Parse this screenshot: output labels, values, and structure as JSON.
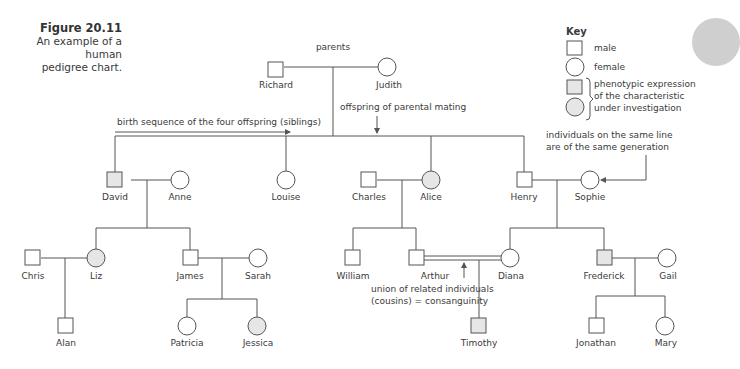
{
  "figure": {
    "number": "Figure 20.11",
    "caption_line1": "An example of a human",
    "caption_line2": "pedigree chart."
  },
  "key": {
    "title": "Key",
    "male": "male",
    "female": "female",
    "affected_line1": "phenotypic expression",
    "affected_line2": "of the characteristic",
    "affected_line3": "under investigation"
  },
  "annotations": {
    "parents": "parents",
    "offspring": "offspring of parental mating",
    "birth_sequence": "birth sequence of the four offspring (siblings)",
    "generation_line1": "individuals on the same line",
    "generation_line2": "are of the same generation",
    "consanguinity_line1": "union of related individuals",
    "consanguinity_line2": "(cousins) = consanguinity"
  },
  "colors": {
    "line": "#555555",
    "affected_fill": "#e6e6e6",
    "unaffected_fill": "#ffffff"
  },
  "individuals": [
    {
      "name": "Richard",
      "sex": "male",
      "affected": false,
      "generation": 1
    },
    {
      "name": "Judith",
      "sex": "female",
      "affected": false,
      "generation": 1
    },
    {
      "name": "David",
      "sex": "male",
      "affected": true,
      "generation": 2
    },
    {
      "name": "Anne",
      "sex": "female",
      "affected": false,
      "generation": 2
    },
    {
      "name": "Louise",
      "sex": "female",
      "affected": false,
      "generation": 2
    },
    {
      "name": "Charles",
      "sex": "male",
      "affected": false,
      "generation": 2
    },
    {
      "name": "Alice",
      "sex": "female",
      "affected": true,
      "generation": 2
    },
    {
      "name": "Henry",
      "sex": "male",
      "affected": false,
      "generation": 2
    },
    {
      "name": "Sophie",
      "sex": "female",
      "affected": false,
      "generation": 2
    },
    {
      "name": "Chris",
      "sex": "male",
      "affected": false,
      "generation": 3
    },
    {
      "name": "Liz",
      "sex": "female",
      "affected": true,
      "generation": 3
    },
    {
      "name": "James",
      "sex": "male",
      "affected": false,
      "generation": 3
    },
    {
      "name": "Sarah",
      "sex": "female",
      "affected": false,
      "generation": 3
    },
    {
      "name": "William",
      "sex": "male",
      "affected": false,
      "generation": 3
    },
    {
      "name": "Arthur",
      "sex": "male",
      "affected": false,
      "generation": 3
    },
    {
      "name": "Diana",
      "sex": "female",
      "affected": false,
      "generation": 3
    },
    {
      "name": "Frederick",
      "sex": "male",
      "affected": true,
      "generation": 3
    },
    {
      "name": "Gail",
      "sex": "female",
      "affected": false,
      "generation": 3
    },
    {
      "name": "Alan",
      "sex": "male",
      "affected": false,
      "generation": 4
    },
    {
      "name": "Patricia",
      "sex": "female",
      "affected": false,
      "generation": 4
    },
    {
      "name": "Jessica",
      "sex": "female",
      "affected": true,
      "generation": 4
    },
    {
      "name": "Timothy",
      "sex": "male",
      "affected": true,
      "generation": 4
    },
    {
      "name": "Jonathan",
      "sex": "male",
      "affected": false,
      "generation": 4
    },
    {
      "name": "Mary",
      "sex": "female",
      "affected": false,
      "generation": 4
    }
  ]
}
